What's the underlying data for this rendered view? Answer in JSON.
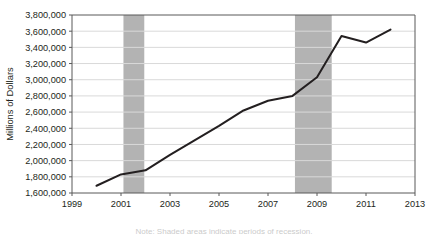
{
  "chart_data": {
    "type": "line",
    "title": "",
    "xlabel": "",
    "ylabel": "Millions of Dollars",
    "xlim": [
      1999,
      2013
    ],
    "ylim": [
      1600000,
      3800000
    ],
    "grid": true,
    "legend": "none",
    "x": [
      2000,
      2001,
      2002,
      2003,
      2004,
      2005,
      2006,
      2007,
      2008,
      2009,
      2010,
      2011,
      2012
    ],
    "values": [
      1690000,
      1830000,
      1880000,
      2070000,
      2250000,
      2430000,
      2620000,
      2740000,
      2800000,
      3030000,
      3540000,
      3460000,
      3620000
    ],
    "series": [
      {
        "name": "Millions of Dollars",
        "values": [
          1690000,
          1830000,
          1880000,
          2070000,
          2250000,
          2430000,
          2620000,
          2740000,
          2800000,
          3030000,
          3540000,
          3460000,
          3620000
        ]
      }
    ],
    "ytick_labels": [
      "3,800,000",
      "3,600,000",
      "3,400,000",
      "3,200,000",
      "3,000,000",
      "2,800,000",
      "2,600,000",
      "2,400,000",
      "2,200,000",
      "2,000,000",
      "1,800,000",
      "1,600,000"
    ],
    "ytick_values": [
      3800000,
      3600000,
      3400000,
      3200000,
      3000000,
      2800000,
      2600000,
      2400000,
      2200000,
      2000000,
      1800000,
      1600000
    ],
    "xtick_labels": [
      "1999",
      "2001",
      "2003",
      "2005",
      "2007",
      "2009",
      "2011",
      "2013"
    ],
    "xtick_values": [
      1999,
      2001,
      2003,
      2005,
      2007,
      2009,
      2011,
      2013
    ],
    "shaded_bands": [
      {
        "name": "recession-band-2001",
        "start": 2001.1,
        "end": 2001.95
      },
      {
        "name": "recession-band-2008",
        "start": 2008.1,
        "end": 2009.6
      }
    ],
    "colors": {
      "line": "#231f20",
      "band": "#b3b3b3",
      "grid": "#d9d9d9",
      "axis": "#595959",
      "background": "#ffffff"
    }
  },
  "caption": {
    "text": "Note: Shaded areas indicate periods of recession."
  }
}
